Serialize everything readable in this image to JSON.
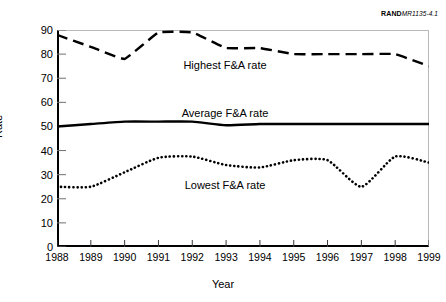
{
  "credit": {
    "organization": "RAND",
    "document_id": "MR1135-4.1"
  },
  "chart_data": {
    "type": "line",
    "title": "",
    "xlabel": "Year",
    "ylabel": "Rate",
    "grid": false,
    "legend_position": "inline-on-plot",
    "xlim": [
      1988,
      1999
    ],
    "ylim": [
      0,
      90
    ],
    "ytick_labels": [
      "0",
      "10",
      "20",
      "30",
      "40",
      "50",
      "60",
      "70",
      "80",
      "90"
    ],
    "yticks": [
      0,
      10,
      20,
      30,
      40,
      50,
      60,
      70,
      80,
      90
    ],
    "categories": [
      1988,
      1989,
      1990,
      1991,
      1992,
      1993,
      1994,
      1995,
      1996,
      1997,
      1998,
      1999
    ],
    "xtick_labels": [
      "1988",
      "1989",
      "1990",
      "1991",
      "1992",
      "1993",
      "1994",
      "1995",
      "1996",
      "1997",
      "1998",
      "1999"
    ],
    "series": [
      {
        "name": "Highest F&A rate",
        "style": "dashed",
        "color": "#000000",
        "values": [
          88,
          83,
          78,
          89,
          89,
          82.5,
          82.5,
          80,
          80,
          80,
          80,
          75
        ]
      },
      {
        "name": "Average F&A rate",
        "style": "solid",
        "color": "#000000",
        "values": [
          50,
          51,
          52,
          52,
          52,
          50.5,
          51,
          51,
          51,
          51,
          51,
          51
        ]
      },
      {
        "name": "Lowest F&A rate",
        "style": "dotted",
        "color": "#000000",
        "values": [
          25,
          25,
          31,
          37,
          37.5,
          34,
          33,
          36,
          36,
          25,
          37.5,
          35
        ]
      }
    ],
    "annotations": [
      {
        "text": "Highest F&A rate",
        "x": 1991.9,
        "y": 62
      },
      {
        "text": "Average F&A rate",
        "x": 1991.9,
        "y": 57
      },
      {
        "text": "Lowest F&A rate",
        "x": 1991.9,
        "y": 28.5
      }
    ]
  }
}
